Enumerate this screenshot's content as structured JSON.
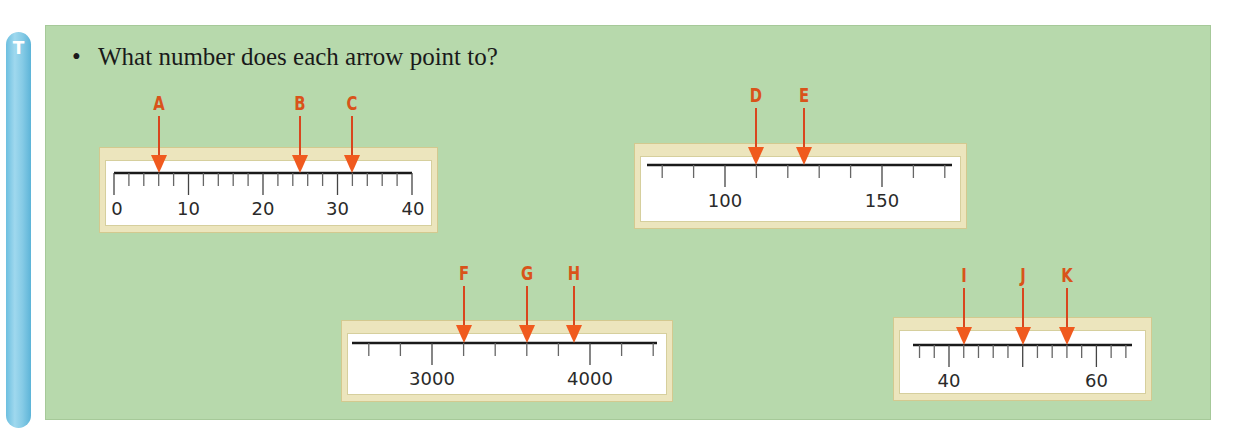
{
  "sidebar": {
    "icon": "T",
    "icon_name": "teacher-t-icon",
    "color": "#86cbe6"
  },
  "panel": {
    "background": "#b7d9ac"
  },
  "question": {
    "bullet": "•",
    "text": "What number does each arrow point to?"
  },
  "colors": {
    "arrow": "#f05a1e",
    "label": "#d9531a",
    "frame": "#ece5bd",
    "line": "#1a1a1a"
  },
  "number_lines": [
    {
      "id": "line-1",
      "frame": {
        "x": 99,
        "y": 147,
        "w": 339,
        "h": 86
      },
      "axis": {
        "x1": 114,
        "x2": 412,
        "y": 173,
        "min": 0,
        "max": 40,
        "step": 2
      },
      "major_every": 10,
      "labels": [
        {
          "value": 0,
          "text": "0"
        },
        {
          "value": 10,
          "text": "10"
        },
        {
          "value": 20,
          "text": "20"
        },
        {
          "value": 30,
          "text": "30"
        },
        {
          "value": 40,
          "text": "40"
        }
      ],
      "arrows": [
        {
          "label": "A",
          "value": 6
        },
        {
          "label": "B",
          "value": 25
        },
        {
          "label": "C",
          "value": 32
        }
      ]
    },
    {
      "id": "line-2",
      "frame": {
        "x": 634,
        "y": 143,
        "w": 333,
        "h": 86
      },
      "axis": {
        "x1": 647,
        "x2": 952,
        "y": 165,
        "min": 75,
        "max": 172,
        "tick_start": 80,
        "tick_end": 170,
        "step": 10,
        "px_per_unit": 3.14,
        "origin_value": 100,
        "origin_x": 725
      },
      "major_every": 50,
      "labels": [
        {
          "value": 100,
          "text": "100"
        },
        {
          "value": 150,
          "text": "150"
        }
      ],
      "arrows": [
        {
          "label": "D",
          "value": 110
        },
        {
          "label": "E",
          "value": 125
        }
      ]
    },
    {
      "id": "line-3",
      "frame": {
        "x": 341,
        "y": 320,
        "w": 332,
        "h": 82
      },
      "axis": {
        "x1": 352,
        "x2": 657,
        "y": 343,
        "tick_start": 2600,
        "tick_end": 4400,
        "step": 200,
        "px_per_unit": 0.158,
        "origin_value": 3000,
        "origin_x": 432
      },
      "major_every": 1000,
      "labels": [
        {
          "value": 3000,
          "text": "3000"
        },
        {
          "value": 4000,
          "text": "4000"
        }
      ],
      "arrows": [
        {
          "label": "F",
          "value": 3200
        },
        {
          "label": "G",
          "value": 3600
        },
        {
          "label": "H",
          "value": 3900
        }
      ]
    },
    {
      "id": "line-4",
      "frame": {
        "x": 893,
        "y": 317,
        "w": 259,
        "h": 84
      },
      "axis": {
        "x1": 913,
        "x2": 1132,
        "y": 345,
        "tick_start": 36,
        "tick_end": 64,
        "step": 2,
        "px_per_unit": 7.37,
        "origin_value": 40,
        "origin_x": 949
      },
      "major_every": 10,
      "labels": [
        {
          "value": 40,
          "text": "40"
        },
        {
          "value": 60,
          "text": "60"
        }
      ],
      "arrows": [
        {
          "label": "I",
          "value": 42
        },
        {
          "label": "J",
          "value": 50
        },
        {
          "label": "K",
          "value": 56
        }
      ]
    }
  ]
}
